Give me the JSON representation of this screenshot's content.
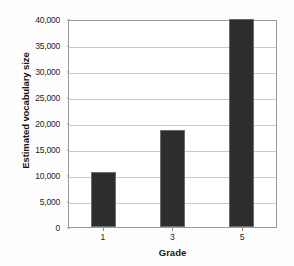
{
  "chart_data": {
    "type": "bar",
    "title": "",
    "xlabel": "Grade",
    "ylabel": "Estimated vocabulary size",
    "categories": [
      "1",
      "3",
      "5"
    ],
    "values": [
      10600,
      18700,
      40000
    ],
    "ylim": [
      0,
      40000
    ],
    "ytick_step": 5000,
    "ytick_labels": [
      "0",
      "5,000",
      "10,000",
      "15,000",
      "20,000",
      "25,000",
      "30,000",
      "35,000",
      "40,000"
    ],
    "ytick_values": [
      0,
      5000,
      10000,
      15000,
      20000,
      25000,
      30000,
      35000,
      40000
    ],
    "grid": true,
    "legend": false,
    "bar_color": "#2d2d2d",
    "bar_edge_color": "#6d6d6d",
    "gridline_color": "#c9c9c9",
    "axis_color": "#9a9a9a",
    "background_color": "#ffffff"
  }
}
